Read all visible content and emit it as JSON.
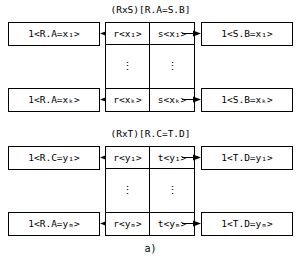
{
  "figure": {
    "caption": "a)",
    "groups": [
      {
        "id": "join-rs",
        "title": "(RxS)[R.A=S.B]",
        "rows": [
          {
            "left_box": "1<R.A=x₁>",
            "center_left": "r<x₁>",
            "center_right": "s<x₁>",
            "right_box": "1<S.B=x₁>"
          },
          {
            "left_box": "1<R.A=xₖ>",
            "center_left": "r<xₖ>",
            "center_right": "s<xₖ>",
            "right_box": "1<S.B=xₖ>"
          }
        ],
        "ellipsis_left": "⋮",
        "ellipsis_right": "⋮",
        "arrow_left_label": "left-arrow",
        "arrow_right_label": "right-arrow"
      },
      {
        "id": "join-rt",
        "title": "(RxT)[R.C=T.D]",
        "rows": [
          {
            "left_box": "1<R.C=y₁>",
            "center_left": "r<y₁>",
            "center_right": "t<y₁>",
            "right_box": "1<T.D=y₁>"
          },
          {
            "left_box": "1<R.A=yₘ>",
            "center_left": "r<yₘ>",
            "center_right": "t<yₘ>",
            "right_box": "1<T.D=yₘ>"
          }
        ],
        "ellipsis_left": "⋮",
        "ellipsis_right": "⋮",
        "arrow_left_label": "left-arrow",
        "arrow_right_label": "right-arrow"
      }
    ]
  },
  "colors": {
    "stroke": "#000000",
    "background": "#ffffff",
    "text": "#000000"
  }
}
